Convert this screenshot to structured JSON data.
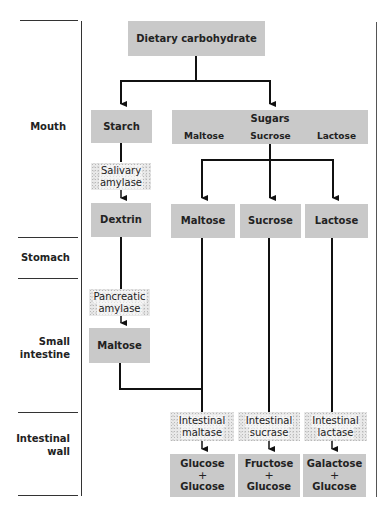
{
  "regions": [
    {
      "id": "mouth",
      "label": "Mouth"
    },
    {
      "id": "stomach",
      "label": "Stomach"
    },
    {
      "id": "small-intestine",
      "label_line1": "Small",
      "label_line2": "intestine"
    },
    {
      "id": "intestinal-wall",
      "label_line1": "Intestinal",
      "label_line2": "wall"
    }
  ],
  "root": {
    "label": "Dietary carbohydrate"
  },
  "mouth": {
    "starch": "Starch",
    "sugars": {
      "title": "Sugars",
      "items": [
        "Maltose",
        "Sucrose",
        "Lactose"
      ]
    },
    "salivary_amylase": {
      "line1": "Salivary",
      "line2": "amylase"
    },
    "dextrin": "Dextrin",
    "disaccharides": [
      "Maltose",
      "Sucrose",
      "Lactose"
    ]
  },
  "small_intestine": {
    "pancreatic_amylase": {
      "line1": "Pancreatic",
      "line2": "amylase"
    },
    "maltose": "Maltose"
  },
  "intestinal_wall": {
    "enzymes": [
      {
        "line1": "Intestinal",
        "line2": "maltase"
      },
      {
        "line1": "Intestinal",
        "line2": "sucrase"
      },
      {
        "line1": "Intestinal",
        "line2": "lactase"
      }
    ],
    "products": [
      {
        "a": "Glucose",
        "plus": "+",
        "b": "Glucose"
      },
      {
        "a": "Fructose",
        "plus": "+",
        "b": "Glucose"
      },
      {
        "a": "Galactose",
        "plus": "+",
        "b": "Glucose"
      }
    ]
  },
  "colors": {
    "box_fill": "#c9c9c9",
    "enzyme_fill": "#e9e9e9",
    "line": "#111111"
  }
}
